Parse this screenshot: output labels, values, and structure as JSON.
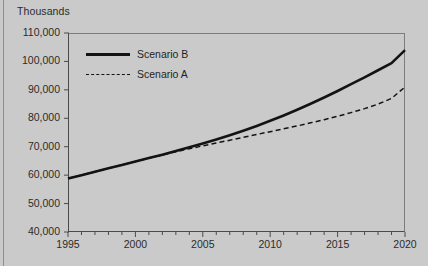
{
  "chart_data": {
    "type": "line",
    "title": "",
    "subtitle": "",
    "units_label": "Thousands",
    "xlabel": "",
    "ylabel": "",
    "xlim": [
      1995,
      2020
    ],
    "ylim": [
      40000,
      110000
    ],
    "grid": false,
    "legend_position": "upper-left-inside",
    "y_ticks": [
      110000,
      100000,
      90000,
      80000,
      70000,
      60000,
      50000,
      40000
    ],
    "y_tick_labels": [
      "110,000",
      "100,000",
      "90,000",
      "80,000",
      "70,000",
      "60,000",
      "50,000",
      "40,000"
    ],
    "x_ticks": [
      1995,
      2000,
      2005,
      2010,
      2015,
      2020
    ],
    "x_tick_labels": [
      "1995",
      "2000",
      "2005",
      "2010",
      "2015",
      "2020"
    ],
    "x_minor_tick_interval": 1,
    "x": [
      1995,
      1996,
      1997,
      1998,
      1999,
      2000,
      2001,
      2002,
      2003,
      2004,
      2005,
      2006,
      2007,
      2008,
      2009,
      2010,
      2011,
      2012,
      2013,
      2014,
      2015,
      2016,
      2017,
      2018,
      2019,
      2020
    ],
    "series": [
      {
        "name": "Scenario B",
        "style": "solid",
        "color": "#131313",
        "values": [
          58800,
          60000,
          61200,
          62400,
          63600,
          64800,
          66000,
          67200,
          68500,
          69800,
          71100,
          72500,
          74000,
          75600,
          77300,
          79100,
          81000,
          83000,
          85100,
          87300,
          89600,
          92000,
          94400,
          96900,
          99400,
          104000
        ]
      },
      {
        "name": "Scenario A",
        "style": "dashed",
        "color": "#131313",
        "values": [
          58800,
          60000,
          61200,
          62400,
          63600,
          64800,
          66000,
          67100,
          68200,
          69300,
          70300,
          71300,
          72300,
          73300,
          74300,
          75300,
          76300,
          77300,
          78400,
          79500,
          80700,
          82000,
          83400,
          85000,
          87000,
          91000
        ]
      }
    ],
    "legend": [
      {
        "label": "Scenario B",
        "style": "solid"
      },
      {
        "label": "Scenario A",
        "style": "dashed"
      }
    ],
    "colors": {
      "background": "#cacaca",
      "line": "#131313",
      "axis": "#4a4a4a",
      "frame": "#7c7c7c",
      "text": "#2a2a2a"
    }
  }
}
